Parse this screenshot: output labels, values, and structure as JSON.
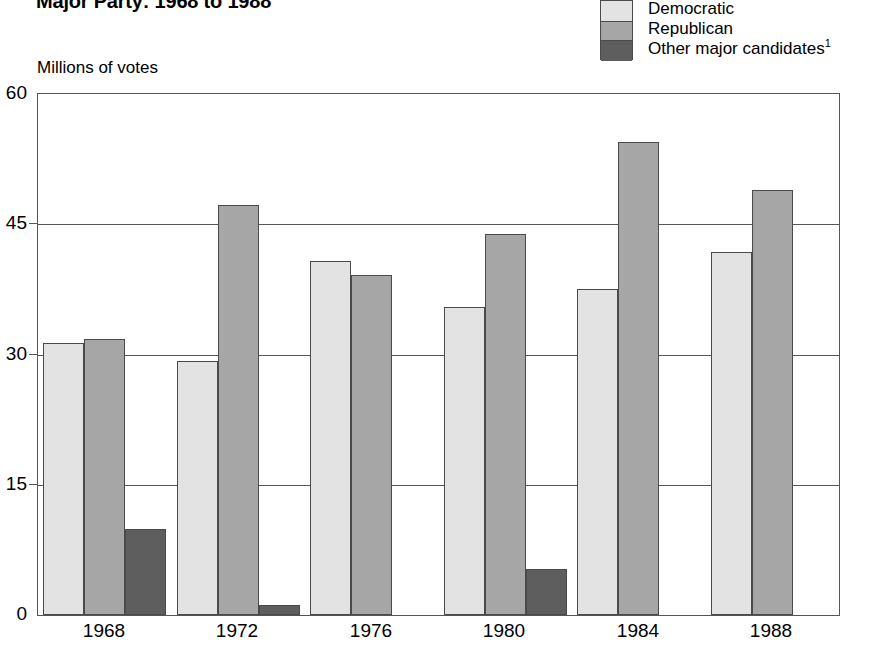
{
  "title": "Major Party: 1968 to 1988",
  "axis_caption": "Millions of votes",
  "legend": {
    "items": [
      {
        "label": "Democratic",
        "color": "#e3e3e3",
        "swatch_name": "legend-swatch-democratic"
      },
      {
        "label": "Republican",
        "color": "#a6a6a6",
        "swatch_name": "legend-swatch-republican"
      },
      {
        "label": "Other major candidates",
        "footnote": "1",
        "color": "#5e5e5e",
        "swatch_name": "legend-swatch-other"
      }
    ]
  },
  "chart_data": {
    "type": "bar",
    "title": "Major Party: 1968 to 1988",
    "subtitle": "",
    "xlabel": "",
    "ylabel": "Millions of votes",
    "ylim": [
      0,
      60
    ],
    "yticks": [
      0,
      15,
      30,
      45,
      60
    ],
    "ytick_labels": [
      "0",
      "15",
      "30",
      "45",
      "60"
    ],
    "grid": true,
    "legend_position": "top-right",
    "categories": [
      "1968",
      "1972",
      "1976",
      "1980",
      "1984",
      "1988"
    ],
    "series": [
      {
        "name": "Democratic",
        "color": "#e3e3e3",
        "values": [
          31.3,
          29.2,
          40.8,
          35.5,
          37.5,
          41.8
        ]
      },
      {
        "name": "Republican",
        "color": "#a6a6a6",
        "values": [
          31.8,
          47.2,
          39.1,
          43.9,
          54.5,
          48.9
        ]
      },
      {
        "name": "Other major candidates",
        "color": "#5e5e5e",
        "values": [
          9.9,
          1.1,
          0,
          5.3,
          0,
          0
        ]
      }
    ],
    "annotations": [
      "1 Footnote marker on 'Other major candidates' legend entry"
    ]
  }
}
